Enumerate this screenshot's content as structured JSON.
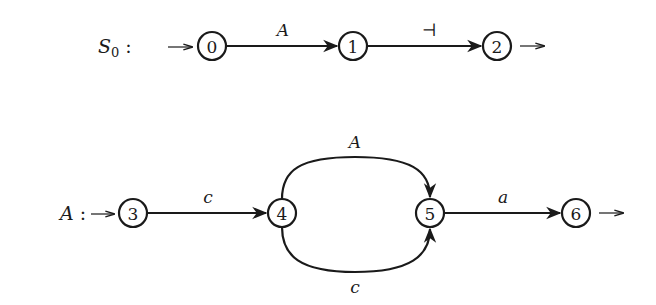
{
  "diagram": {
    "type": "finite-automaton",
    "machines": [
      {
        "name": "S",
        "name_subscript": "0",
        "separator": ":",
        "start_arrow": "→",
        "states": [
          {
            "id": "0",
            "label": "0",
            "x": 212,
            "y": 46
          },
          {
            "id": "1",
            "label": "1",
            "x": 353,
            "y": 46
          },
          {
            "id": "2",
            "label": "2",
            "x": 497,
            "y": 46
          }
        ],
        "transitions": [
          {
            "from": "0",
            "to": "1",
            "label": "A"
          },
          {
            "from": "1",
            "to": "2",
            "label": "⊣"
          }
        ],
        "final_arrow": "→"
      },
      {
        "name": "A",
        "separator": ":",
        "start_arrow": "→",
        "states": [
          {
            "id": "3",
            "label": "3",
            "x": 133,
            "y": 213
          },
          {
            "id": "4",
            "label": "4",
            "x": 282,
            "y": 213
          },
          {
            "id": "5",
            "label": "5",
            "x": 430,
            "y": 213
          },
          {
            "id": "6",
            "label": "6",
            "x": 576,
            "y": 213
          }
        ],
        "transitions": [
          {
            "from": "3",
            "to": "4",
            "label": "c"
          },
          {
            "from": "4",
            "to": "5",
            "label": "A",
            "route": "upper-arc"
          },
          {
            "from": "4",
            "to": "5",
            "label": "c",
            "route": "lower-arc"
          },
          {
            "from": "5",
            "to": "6",
            "label": "a"
          }
        ],
        "final_arrow": "→"
      }
    ]
  }
}
